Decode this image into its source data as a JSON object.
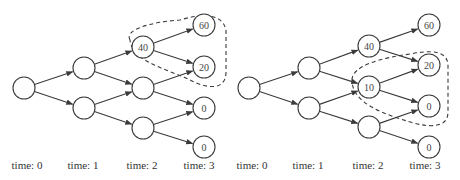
{
  "colors": {
    "stroke": "#3a3a3a",
    "text": "#444444",
    "background": "#ffffff"
  },
  "panels": [
    {
      "name": "left-tree",
      "nodes": [
        {
          "id": "r",
          "x": 24,
          "y": 88,
          "label": ""
        },
        {
          "id": "a",
          "x": 84,
          "y": 68,
          "label": ""
        },
        {
          "id": "b",
          "x": 84,
          "y": 108,
          "label": ""
        },
        {
          "id": "c",
          "x": 143,
          "y": 47,
          "label": "40"
        },
        {
          "id": "d",
          "x": 143,
          "y": 88,
          "label": ""
        },
        {
          "id": "e",
          "x": 143,
          "y": 128,
          "label": ""
        },
        {
          "id": "f",
          "x": 204,
          "y": 25,
          "label": "60"
        },
        {
          "id": "g",
          "x": 204,
          "y": 67,
          "label": "20"
        },
        {
          "id": "h",
          "x": 204,
          "y": 108,
          "label": "0"
        },
        {
          "id": "i",
          "x": 204,
          "y": 147,
          "label": "0"
        }
      ],
      "dashed_region": "M130,40 C124,30 150,22 180,20 C200,14 222,12 226,30 L226,72 C226,92 205,88 190,80 C170,70 132,62 130,40 Z",
      "time_labels": [
        {
          "x": 27,
          "text": "time: 0"
        },
        {
          "x": 83,
          "text": "time: 1"
        },
        {
          "x": 142,
          "text": "time: 2"
        },
        {
          "x": 199,
          "text": "time: 3"
        }
      ]
    },
    {
      "name": "right-tree",
      "nodes": [
        {
          "id": "r",
          "x": 249,
          "y": 88,
          "label": ""
        },
        {
          "id": "a",
          "x": 309,
          "y": 68,
          "label": ""
        },
        {
          "id": "b",
          "x": 309,
          "y": 108,
          "label": ""
        },
        {
          "id": "c",
          "x": 369,
          "y": 46,
          "label": "40"
        },
        {
          "id": "d",
          "x": 369,
          "y": 87,
          "label": "10"
        },
        {
          "id": "e",
          "x": 369,
          "y": 127,
          "label": ""
        },
        {
          "id": "f",
          "x": 429,
          "y": 25,
          "label": "60"
        },
        {
          "id": "g",
          "x": 429,
          "y": 65,
          "label": "20"
        },
        {
          "id": "h",
          "x": 429,
          "y": 106,
          "label": "0"
        },
        {
          "id": "i",
          "x": 429,
          "y": 147,
          "label": "0"
        }
      ],
      "dashed_region": "M352,80 C352,66 380,58 410,54 C430,50 448,50 448,66 L448,112 C448,128 430,128 410,122 C385,114 352,104 352,80 Z",
      "time_labels": [
        {
          "x": 252,
          "text": "time: 0"
        },
        {
          "x": 308,
          "text": "time: 1"
        },
        {
          "x": 368,
          "text": "time: 2"
        },
        {
          "x": 425,
          "text": "time: 3"
        }
      ]
    }
  ],
  "edges": [
    [
      "r",
      "a"
    ],
    [
      "r",
      "b"
    ],
    [
      "a",
      "c"
    ],
    [
      "a",
      "d"
    ],
    [
      "b",
      "d"
    ],
    [
      "b",
      "e"
    ],
    [
      "c",
      "f"
    ],
    [
      "c",
      "g"
    ],
    [
      "d",
      "g"
    ],
    [
      "d",
      "h"
    ],
    [
      "e",
      "h"
    ],
    [
      "e",
      "i"
    ]
  ],
  "node_radius": 11,
  "label_y": 169
}
